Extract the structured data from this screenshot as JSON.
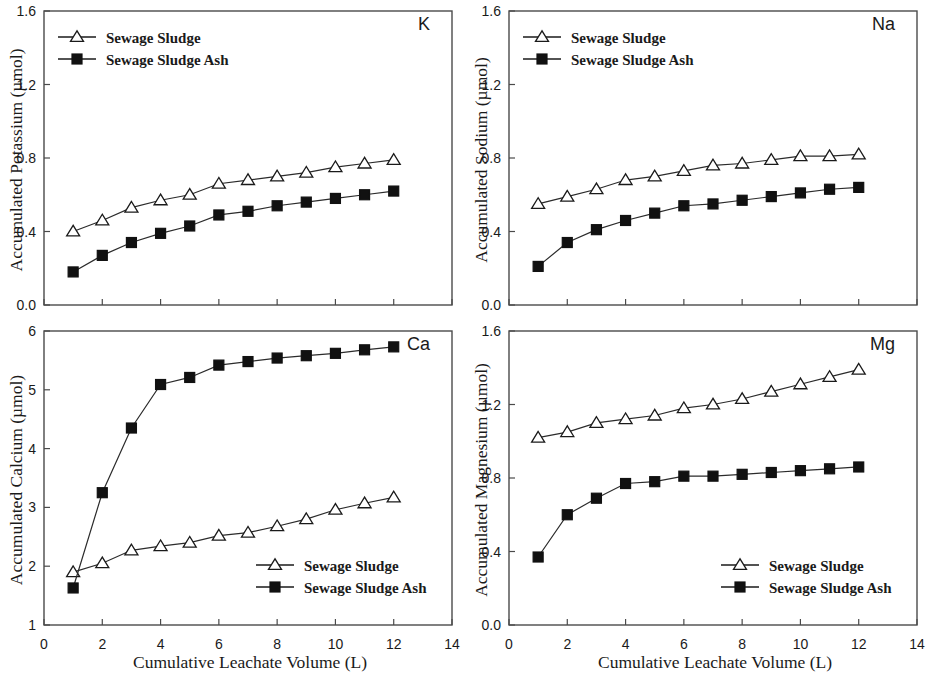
{
  "figure": {
    "background": "#ffffff",
    "line_color": "#2b2b2b",
    "marker_open_fill": "#ffffff",
    "marker_filled_fill": "#111111",
    "shared_xlabel": "Cumulative Leachate Volume (L)",
    "series_names": [
      "Sewage Sludge",
      "Sewage Sludge Ash"
    ],
    "panel_order": [
      "K",
      "Na",
      "Ca",
      "Mg"
    ]
  },
  "legend": {
    "sewage_sludge": "Sewage Sludge",
    "sewage_sludge_ash": "Sewage Sludge Ash",
    "marker_sludge": "open-triangle",
    "marker_ash": "filled-square"
  },
  "axis": {
    "x_ticks": [
      "0",
      "2",
      "4",
      "6",
      "8",
      "10",
      "12",
      "14"
    ],
    "x_min": 0,
    "x_max": 14,
    "x_label": "Cumulative Leachate Volume (L)"
  },
  "panels": {
    "k": {
      "tag": "K",
      "ylabel": "Accumulated Potassium (µmol)",
      "yticks": [
        "0.0",
        "0.4",
        "0.8",
        "1.2",
        "1.6"
      ],
      "legend_position": "top-left"
    },
    "na": {
      "tag": "Na",
      "ylabel": "Accumulated Sodium (µmol)",
      "yticks": [
        "0.0",
        "0.4",
        "0.8",
        "1.2",
        "1.6"
      ],
      "legend_position": "top-left"
    },
    "ca": {
      "tag": "Ca",
      "ylabel": "Accumulated Calcium (µmol)",
      "yticks": [
        "1",
        "2",
        "3",
        "4",
        "5",
        "6"
      ],
      "legend_position": "bottom-right"
    },
    "mg": {
      "tag": "Mg",
      "ylabel": "Accumulated Magnesium (µmol)",
      "yticks": [
        "0.0",
        "0.4",
        "0.8",
        "1.2",
        "1.6"
      ],
      "legend_position": "bottom-right"
    }
  },
  "chart_data": [
    {
      "type": "line",
      "id": "k",
      "title": "K",
      "xlabel": "Cumulative Leachate Volume (L)",
      "ylabel": "Accumulated Potassium (µmol)",
      "xlim": [
        0,
        14
      ],
      "ylim": [
        0.0,
        1.6
      ],
      "xticks": [
        0,
        2,
        4,
        6,
        8,
        10,
        12,
        14
      ],
      "yticks": [
        0.0,
        0.4,
        0.8,
        1.2,
        1.6
      ],
      "grid": false,
      "legend_position": "top-left",
      "x": [
        1,
        2,
        3,
        4,
        5,
        6,
        7,
        8,
        9,
        10,
        11,
        12
      ],
      "series": [
        {
          "name": "Sewage Sludge",
          "marker": "open-triangle",
          "values": [
            0.4,
            0.46,
            0.53,
            0.57,
            0.6,
            0.66,
            0.68,
            0.7,
            0.72,
            0.75,
            0.77,
            0.79
          ]
        },
        {
          "name": "Sewage Sludge Ash",
          "marker": "filled-square",
          "values": [
            0.18,
            0.27,
            0.34,
            0.39,
            0.43,
            0.49,
            0.51,
            0.54,
            0.56,
            0.58,
            0.6,
            0.62
          ]
        }
      ]
    },
    {
      "type": "line",
      "id": "na",
      "title": "Na",
      "xlabel": "Cumulative Leachate Volume (L)",
      "ylabel": "Accumulated Sodium (µmol)",
      "xlim": [
        0,
        14
      ],
      "ylim": [
        0.0,
        1.6
      ],
      "xticks": [
        0,
        2,
        4,
        6,
        8,
        10,
        12,
        14
      ],
      "yticks": [
        0.0,
        0.4,
        0.8,
        1.2,
        1.6
      ],
      "grid": false,
      "legend_position": "top-left",
      "x": [
        1,
        2,
        3,
        4,
        5,
        6,
        7,
        8,
        9,
        10,
        11,
        12
      ],
      "series": [
        {
          "name": "Sewage Sludge",
          "marker": "open-triangle",
          "values": [
            0.55,
            0.59,
            0.63,
            0.68,
            0.7,
            0.73,
            0.76,
            0.77,
            0.79,
            0.81,
            0.81,
            0.82
          ]
        },
        {
          "name": "Sewage Sludge Ash",
          "marker": "filled-square",
          "values": [
            0.21,
            0.34,
            0.41,
            0.46,
            0.5,
            0.54,
            0.55,
            0.57,
            0.59,
            0.61,
            0.63,
            0.64
          ]
        }
      ]
    },
    {
      "type": "line",
      "id": "ca",
      "title": "Ca",
      "xlabel": "Cumulative Leachate Volume (L)",
      "ylabel": "Accumulated Calcium (µmol)",
      "xlim": [
        0,
        14
      ],
      "ylim": [
        1,
        6
      ],
      "xticks": [
        0,
        2,
        4,
        6,
        8,
        10,
        12,
        14
      ],
      "yticks": [
        1,
        2,
        3,
        4,
        5,
        6
      ],
      "grid": false,
      "legend_position": "bottom-right",
      "x": [
        1,
        2,
        3,
        4,
        5,
        6,
        7,
        8,
        9,
        10,
        11,
        12
      ],
      "series": [
        {
          "name": "Sewage Sludge",
          "marker": "open-triangle",
          "values": [
            1.9,
            2.05,
            2.27,
            2.34,
            2.4,
            2.52,
            2.57,
            2.68,
            2.8,
            2.96,
            3.07,
            3.17
          ]
        },
        {
          "name": "Sewage Sludge Ash",
          "marker": "filled-square",
          "values": [
            1.63,
            3.25,
            4.35,
            5.09,
            5.21,
            5.42,
            5.48,
            5.54,
            5.58,
            5.62,
            5.68,
            5.73
          ]
        }
      ]
    },
    {
      "type": "line",
      "id": "mg",
      "title": "Mg",
      "xlabel": "Cumulative Leachate Volume (L)",
      "ylabel": "Accumulated Magnesium (µmol)",
      "xlim": [
        0,
        14
      ],
      "ylim": [
        0.0,
        1.6
      ],
      "xticks": [
        0,
        2,
        4,
        6,
        8,
        10,
        12,
        14
      ],
      "yticks": [
        0.0,
        0.4,
        0.8,
        1.2,
        1.6
      ],
      "grid": false,
      "legend_position": "bottom-right",
      "x": [
        1,
        2,
        3,
        4,
        5,
        6,
        7,
        8,
        9,
        10,
        11,
        12
      ],
      "series": [
        {
          "name": "Sewage Sludge",
          "marker": "open-triangle",
          "values": [
            1.02,
            1.05,
            1.1,
            1.12,
            1.14,
            1.18,
            1.2,
            1.23,
            1.27,
            1.31,
            1.35,
            1.39
          ]
        },
        {
          "name": "Sewage Sludge Ash",
          "marker": "filled-square",
          "values": [
            0.37,
            0.6,
            0.69,
            0.77,
            0.78,
            0.81,
            0.81,
            0.82,
            0.83,
            0.84,
            0.85,
            0.86
          ]
        }
      ]
    }
  ]
}
